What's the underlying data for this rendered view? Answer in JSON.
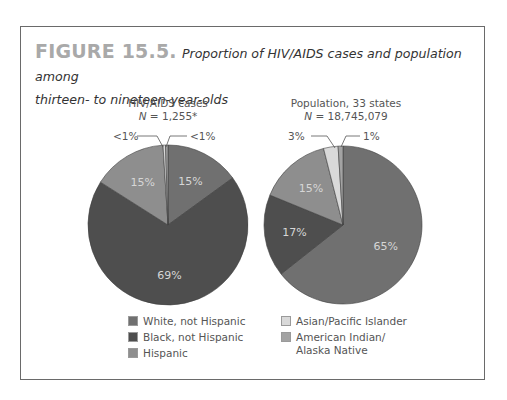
{
  "figure": {
    "number": "FIGURE 15.5.",
    "caption_line1": "Proportion of HIV/AIDS cases and population among",
    "caption_line2": "thirteen- to nineteen-year-olds"
  },
  "colors": {
    "white_not_hispanic": "#707070",
    "black_not_hispanic": "#4e4e4e",
    "hispanic": "#8e8e8e",
    "asian_pacific_islander": "#d9d9d9",
    "american_indian_alaska_native": "#a3a3a3"
  },
  "pies": [
    {
      "title": "HIV/AIDS cases",
      "n_label": "N",
      "n_value": " = 1,255*",
      "callout_left": "<1%",
      "callout_right": "<1%"
    },
    {
      "title": "Population, 33 states",
      "n_label": "N",
      "n_value": " = 18,745,079",
      "callout_left": "3%",
      "callout_right": "1%"
    }
  ],
  "legend": {
    "items": [
      {
        "label": "White, not Hispanic",
        "color": "#707070"
      },
      {
        "label": "Black, not Hispanic",
        "color": "#4e4e4e"
      },
      {
        "label": "Hispanic",
        "color": "#8e8e8e"
      },
      {
        "label": "Asian/Pacific Islander",
        "color": "#d9d9d9"
      },
      {
        "label": "American Indian/",
        "label2": "Alaska Native",
        "color": "#a3a3a3"
      }
    ]
  },
  "chart_data": [
    {
      "type": "pie",
      "title": "HIV/AIDS cases, N = 1,255*",
      "categories": [
        "White, not Hispanic",
        "Black, not Hispanic",
        "Hispanic",
        "Asian/Pacific Islander",
        "American Indian/Alaska Native"
      ],
      "values": [
        15,
        69,
        15,
        0.5,
        0.5
      ],
      "labels": [
        "15%",
        "69%",
        "15%",
        "<1%",
        "<1%"
      ],
      "legend_position": "bottom"
    },
    {
      "type": "pie",
      "title": "Population, 33 states, N = 18,745,079",
      "categories": [
        "White, not Hispanic",
        "Black, not Hispanic",
        "Hispanic",
        "Asian/Pacific Islander",
        "American Indian/Alaska Native"
      ],
      "values": [
        65,
        17,
        15,
        3,
        1
      ],
      "labels": [
        "65%",
        "17%",
        "15%",
        "3%",
        "1%"
      ],
      "legend_position": "bottom"
    }
  ]
}
